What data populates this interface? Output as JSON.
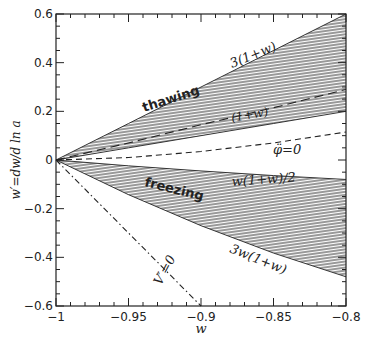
{
  "chart_data": {
    "type": "area",
    "title": "",
    "xlabel": "w",
    "ylabel": "w′=dw/d ln a",
    "xlim": [
      -1,
      -0.8
    ],
    "ylim": [
      -0.6,
      0.6
    ],
    "x_ticks": [
      -1,
      -0.95,
      -0.9,
      -0.85,
      -0.8
    ],
    "x_tick_labels": [
      "−1",
      "−0.95",
      "−0.9",
      "−0.85",
      "−0.8"
    ],
    "x_minor_step": 0.01,
    "y_ticks": [
      -0.6,
      -0.4,
      -0.2,
      0,
      0.2,
      0.4,
      0.6
    ],
    "y_tick_labels": [
      "−0.6",
      "−0.4",
      "−0.2",
      "0",
      "0.2",
      "0.4",
      "0.6"
    ],
    "y_minor_step": 0.05,
    "grid": false,
    "x": [
      -1.0,
      -0.95,
      -0.9,
      -0.85,
      -0.8
    ],
    "series": [
      {
        "name": "3(1+w)",
        "style": "solid",
        "role": "thawing upper bound",
        "values": [
          0.0,
          0.15,
          0.3,
          0.45,
          0.6
        ]
      },
      {
        "name": "(1+w)",
        "style": "solid",
        "role": "thawing lower bound",
        "values": [
          0.0,
          0.05,
          0.1,
          0.15,
          0.2
        ]
      },
      {
        "name": "thawing-inner-dashed",
        "style": "long-dash",
        "values": [
          0.0,
          0.07,
          0.145,
          0.215,
          0.29
        ]
      },
      {
        "name": "φ̈=0",
        "style": "dashed",
        "values": [
          0.0,
          0.01,
          0.035,
          0.07,
          0.115
        ]
      },
      {
        "name": "w(1+w)/2",
        "style": "solid",
        "role": "freezing upper bound",
        "values": [
          0.0,
          -0.024,
          -0.045,
          -0.064,
          -0.08
        ]
      },
      {
        "name": "3w(1+w)",
        "style": "solid",
        "role": "freezing lower bound",
        "values": [
          0.0,
          -0.1425,
          -0.27,
          -0.3825,
          -0.48
        ]
      },
      {
        "name": "V′=0",
        "style": "dash-dot",
        "values": [
          0.0,
          -0.3,
          -0.6,
          null,
          null
        ]
      }
    ],
    "regions": [
      {
        "name": "thawing",
        "between": [
          "(1+w)",
          "3(1+w)"
        ],
        "fill": "hatched"
      },
      {
        "name": "freezing",
        "between": [
          "3w(1+w)",
          "w(1+w)/2"
        ],
        "fill": "hatched"
      }
    ],
    "annotations": [
      {
        "text": "3(1+w)",
        "x": -0.835,
        "y": 0.47
      },
      {
        "text": "thawing",
        "x": -0.935,
        "y": 0.2
      },
      {
        "text": "(1+w)",
        "x": -0.84,
        "y": 0.19
      },
      {
        "text": "φ̈=0",
        "x": -0.83,
        "y": 0.06
      },
      {
        "text": "freezing",
        "x": -0.925,
        "y": -0.13
      },
      {
        "text": "w(1+w)/2",
        "x": -0.84,
        "y": -0.08
      },
      {
        "text": "3w(1+w)",
        "x": -0.86,
        "y": -0.39
      },
      {
        "text": "V′=0",
        "x": -0.915,
        "y": -0.49
      }
    ]
  },
  "labels": {
    "xlabel": "w",
    "ylabel": "w′=dw/d ln a",
    "thawing": "thawing",
    "freezing": "freezing",
    "ann_3_1pw": "3(1+w)",
    "ann_1pw": "(1+w)",
    "ann_phidd": "φ̈=0",
    "ann_w1pw2": "w(1+w)/2",
    "ann_3w1pw": "3w(1+w)",
    "ann_vprime": "V′=0"
  }
}
